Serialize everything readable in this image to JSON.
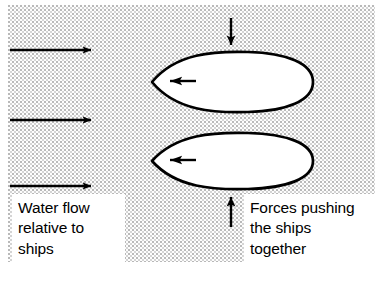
{
  "figure": {
    "kind": "scanned-textbook-diagram",
    "background_color": "#fdfdfd",
    "ink_color": "#000000",
    "hull_fill_color": "#ffffff",
    "stipple_color": "#b9b9b9"
  },
  "captions": {
    "water_flow": "Water flow\nrelative to\nships",
    "forces": "Forces pushing\nthe ships\ntogether"
  },
  "flow_arrows": {
    "label": "Water flow relative to ships",
    "direction": "right",
    "count": 3,
    "items": [
      {
        "x1": 10,
        "y1": 50,
        "x2": 97,
        "y2": 50
      },
      {
        "x1": 10,
        "y1": 120,
        "x2": 97,
        "y2": 120
      },
      {
        "x1": 10,
        "y1": 186,
        "x2": 97,
        "y2": 186
      }
    ]
  },
  "hulls": {
    "label": "Ship hulls seen from above",
    "count": 2,
    "items": [
      {
        "name": "upper-ship-hull",
        "bow_x": 152,
        "stern_x": 313,
        "center_y": 82,
        "half_height": 27,
        "motion_arrow": {
          "x1": 195,
          "y1": 81,
          "x2": 160,
          "y2": 81,
          "direction": "left"
        }
      },
      {
        "name": "lower-ship-hull",
        "bow_x": 152,
        "stern_x": 313,
        "center_y": 161,
        "half_height": 25,
        "motion_arrow": {
          "x1": 195,
          "y1": 160,
          "x2": 160,
          "y2": 160,
          "direction": "left"
        }
      }
    ]
  },
  "force_arrows": {
    "label": "Forces pushing the ships together",
    "count": 2,
    "items": [
      {
        "name": "upper-force-arrow",
        "x": 231,
        "y1": 18,
        "y2": 54,
        "direction": "down"
      },
      {
        "name": "lower-force-arrow",
        "x": 231,
        "y1": 227,
        "y2": 188,
        "direction": "up"
      }
    ]
  }
}
